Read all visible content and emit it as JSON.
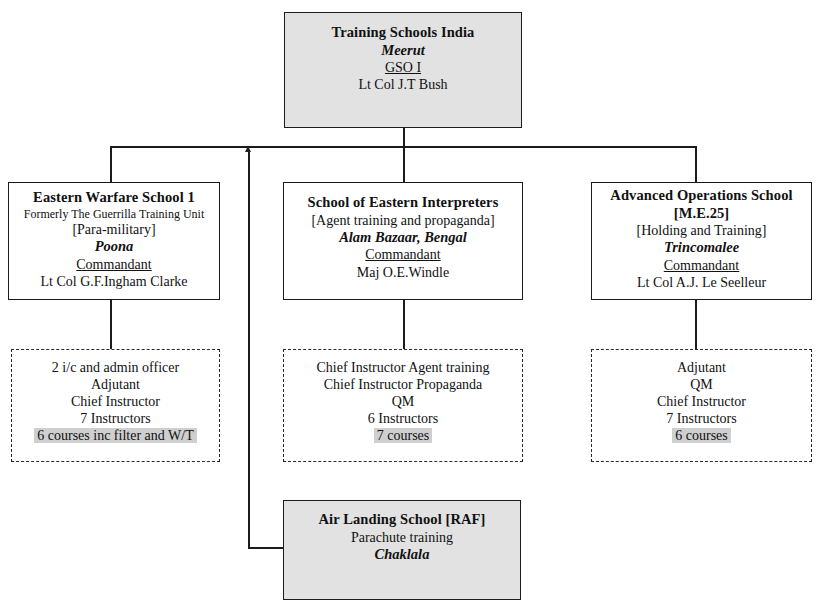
{
  "diagram": {
    "type": "organizational-chart",
    "title_node": "Training Schools India",
    "nodes": {
      "root": {
        "name": "training-schools-india",
        "style": "shaded",
        "lines": [
          {
            "text": "Training Schools India",
            "style": "title"
          },
          {
            "text": "Meerut",
            "style": "place"
          },
          {
            "text": "GSO I",
            "style": "role-underline"
          },
          {
            "text": "Lt Col J.T Bush",
            "style": "plain"
          }
        ]
      },
      "eastern_warfare": {
        "name": "eastern-warfare-school-1",
        "style": "plain",
        "lines": [
          {
            "text": "Eastern Warfare School 1",
            "style": "title"
          },
          {
            "text": "Formerly The Guerrilla Training Unit",
            "style": "small"
          },
          {
            "text": "[Para-military]",
            "style": "bracket"
          },
          {
            "text": "Poona",
            "style": "place"
          },
          {
            "text": "Commandant",
            "style": "role-underline"
          },
          {
            "text": "Lt Col G.F.Ingham Clarke",
            "style": "plain"
          }
        ]
      },
      "eastern_interpreters": {
        "name": "school-of-eastern-interpreters",
        "style": "plain",
        "lines": [
          {
            "text": "School of Eastern Interpreters",
            "style": "title"
          },
          {
            "text": "[Agent training and propaganda]",
            "style": "bracket"
          },
          {
            "text": "Alam Bazaar, Bengal",
            "style": "place"
          },
          {
            "text": "Commandant",
            "style": "role-underline"
          },
          {
            "text": "Maj O.E.Windle",
            "style": "plain"
          }
        ]
      },
      "advanced_operations": {
        "name": "advanced-operations-school",
        "style": "plain",
        "lines": [
          {
            "text": "Advanced Operations School",
            "style": "title"
          },
          {
            "text": "[M.E.25]",
            "style": "title"
          },
          {
            "text": "[Holding and Training]",
            "style": "bracket"
          },
          {
            "text": "Trincomalee",
            "style": "place"
          },
          {
            "text": "Commandant",
            "style": "role-underline"
          },
          {
            "text": "Lt Col A.J. Le Seelleur",
            "style": "plain"
          }
        ]
      },
      "eastern_warfare_staff": {
        "name": "eastern-warfare-school-staff",
        "style": "dashed",
        "lines": [
          {
            "text": "2 i/c and admin officer",
            "style": "plain"
          },
          {
            "text": "Adjutant",
            "style": "plain"
          },
          {
            "text": "Chief Instructor",
            "style": "plain"
          },
          {
            "text": "7 Instructors",
            "style": "plain"
          },
          {
            "text": "6 courses inc filter and W/T",
            "style": "highlight"
          }
        ]
      },
      "eastern_interpreters_staff": {
        "name": "school-of-eastern-interpreters-staff",
        "style": "dashed",
        "lines": [
          {
            "text": "Chief Instructor Agent training",
            "style": "plain"
          },
          {
            "text": "Chief Instructor Propaganda",
            "style": "plain"
          },
          {
            "text": "QM",
            "style": "plain"
          },
          {
            "text": "6 Instructors",
            "style": "plain"
          },
          {
            "text": "7 courses",
            "style": "highlight"
          }
        ]
      },
      "advanced_operations_staff": {
        "name": "advanced-operations-school-staff",
        "style": "dashed",
        "lines": [
          {
            "text": "Adjutant",
            "style": "plain"
          },
          {
            "text": "QM",
            "style": "plain"
          },
          {
            "text": "Chief Instructor",
            "style": "plain"
          },
          {
            "text": "7 Instructors",
            "style": "plain"
          },
          {
            "text": "6 courses",
            "style": "highlight"
          }
        ]
      },
      "air_landing": {
        "name": "air-landing-school-raf",
        "style": "shaded",
        "lines": [
          {
            "text": "Air Landing School [RAF]",
            "style": "title"
          },
          {
            "text": "Parachute training",
            "style": "plain"
          },
          {
            "text": "Chaklala",
            "style": "place"
          }
        ]
      }
    },
    "colors": {
      "shaded_fill": "#e2e2e2",
      "highlight_fill": "#cfcfcf",
      "line": "#1b1b1b",
      "background": "#ffffff"
    }
  }
}
